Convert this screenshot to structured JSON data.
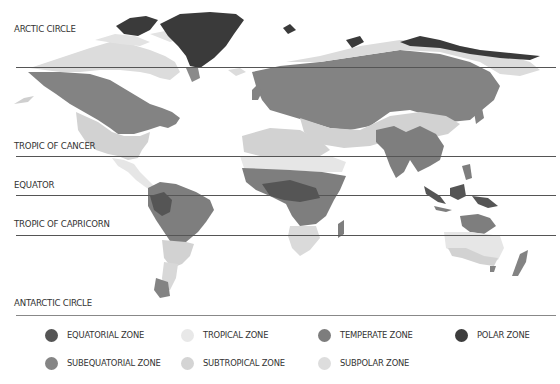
{
  "map": {
    "lines": [
      {
        "label": "ARCTIC CIRCLE",
        "y": 67
      },
      {
        "label": "TROPIC OF CANCER",
        "y": 156
      },
      {
        "label": "EQUATOR",
        "y": 195
      },
      {
        "label": "TROPIC OF CAPRICORN",
        "y": 235
      },
      {
        "label": "ANTARCTIC CIRCLE",
        "y": 315
      }
    ]
  },
  "colors": {
    "equatorial": "#555555",
    "subequatorial": "#7e7e7e",
    "tropical": "#e6e6e6",
    "subtropical": "#d2d2d2",
    "temperate": "#838383",
    "subpolar": "#dcdcdc",
    "polar": "#3a3a3a"
  },
  "legend": {
    "items": [
      {
        "label": "EQUATORIAL ZONE",
        "color": "#555555"
      },
      {
        "label": "TROPICAL ZONE",
        "color": "#e8e8e8"
      },
      {
        "label": "TEMPERATE ZONE",
        "color": "#7d7d7d"
      },
      {
        "label": "POLAR ZONE",
        "color": "#3d3d3d"
      },
      {
        "label": "SUBEQUATORIAL ZONE",
        "color": "#858585"
      },
      {
        "label": "SUBTROPICAL ZONE",
        "color": "#d4d4d4"
      },
      {
        "label": "SUBPOLAR ZONE",
        "color": "#dddddd"
      }
    ]
  }
}
